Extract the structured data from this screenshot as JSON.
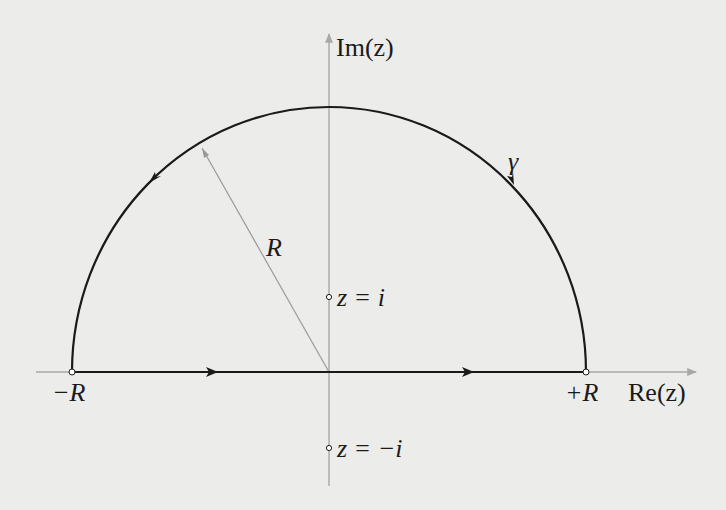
{
  "diagram": {
    "axes": {
      "x_label": "Re(z)",
      "y_label": "Im(z)"
    },
    "contour": {
      "name": "γ",
      "radius_label": "R",
      "left_endpoint_label": "−R",
      "right_endpoint_label": "+R"
    },
    "poles": [
      {
        "label": "z = i"
      },
      {
        "label": "z = −i"
      }
    ],
    "colors": {
      "background": "#ececea",
      "contour": "#1a1a1a",
      "axes": "#a8a8a8"
    }
  }
}
